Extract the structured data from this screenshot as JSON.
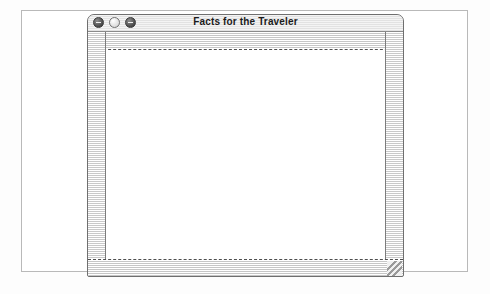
{
  "window": {
    "title": "Facts for the Traveler",
    "traffic_lights": [
      {
        "name": "close-button",
        "style": "dark",
        "glyph": "dash"
      },
      {
        "name": "minimize-button",
        "style": "light-fill",
        "glyph": "none"
      },
      {
        "name": "zoom-button",
        "style": "dark",
        "glyph": "dash"
      }
    ],
    "content": {
      "text": ""
    },
    "scrollbars": {
      "top_icon": "scroll-track-horizontal",
      "bottom_icon": "scroll-track-horizontal",
      "left_icon": "scroll-track-vertical",
      "right_icon": "scroll-track-vertical",
      "grip_icon": "resize-grip-icon"
    }
  },
  "colors": {
    "frame_border": "#b9b9b9",
    "window_border": "#6f6f6f",
    "titlebar_text": "#1b1b1b",
    "stripe": "#c6c6c6",
    "content_background": "#ffffff"
  }
}
